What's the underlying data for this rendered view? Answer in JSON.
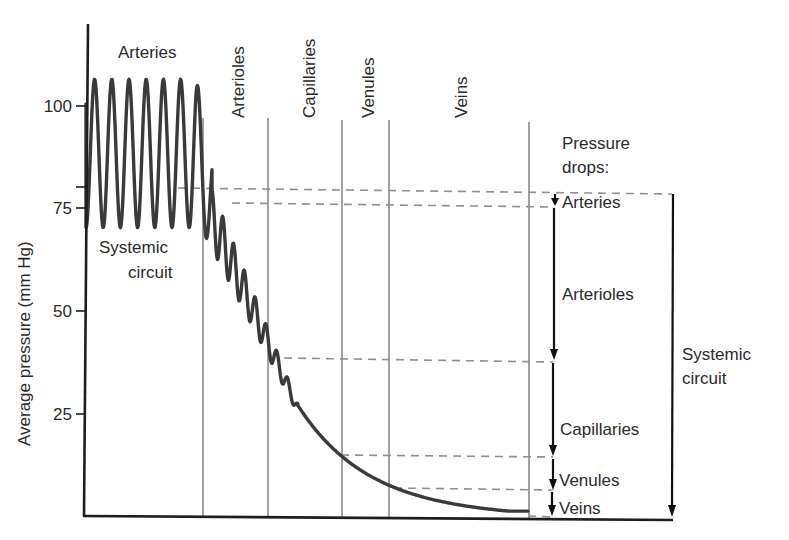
{
  "chart_data": {
    "type": "line",
    "title": "",
    "xlabel": "",
    "ylabel": "Average pressure (mm Hg)",
    "ylim": [
      0,
      120
    ],
    "yticks": [
      25,
      50,
      75,
      100
    ],
    "grid": false,
    "segments": [
      "Arteries",
      "Arterioles",
      "Capillaries",
      "Venules",
      "Veins"
    ],
    "segment_boundaries_px": [
      84,
      203,
      268,
      342,
      389,
      529
    ],
    "series": [
      {
        "name": "Systemic circuit pressure",
        "description": "Pulsatile pressure in arteries oscillating ~70-106 mm Hg (mean ~93), damped oscillations through arterioles falling to ~35 mm Hg, smooth decline through capillaries, venules and veins to ~0-2 mm Hg",
        "points": [
          {
            "segment": "Arteries",
            "systolic": 106,
            "diastolic": 70,
            "mean": 93
          },
          {
            "segment": "Arterioles (start)",
            "mean": 78
          },
          {
            "segment": "Arterioles/Capillaries boundary",
            "mean": 37
          },
          {
            "segment": "Capillaries/Venules boundary",
            "mean": 15
          },
          {
            "segment": "Venules/Veins boundary",
            "mean": 6
          },
          {
            "segment": "Veins (end)",
            "mean": 0
          }
        ]
      }
    ],
    "pressure_drop_levels_mmHg": [
      79,
      76,
      38,
      15,
      7,
      0
    ],
    "annotations": [
      "Arteries",
      "Systemic circuit",
      "Pressure drops:",
      "Arteries",
      "Arterioles",
      "Capillaries",
      "Venules",
      "Veins",
      "Systemic circuit"
    ]
  },
  "labels": {
    "y_axis": "Average pressure (mm Hg)",
    "ticks": [
      "100",
      "75",
      "50",
      "25"
    ],
    "region_arteries": "Arteries",
    "region_arteries_sub_line1": "Systemic",
    "region_arteries_sub_line2": "circuit",
    "region_arterioles": "Arterioles",
    "region_capillaries": "Capillaries",
    "region_venules": "Venules",
    "region_veins": "Veins",
    "drops_title_line1": "Pressure",
    "drops_title_line2": "drops:",
    "drop_arteries": "Arteries",
    "drop_arterioles": "Arterioles",
    "drop_capillaries": "Capillaries",
    "drop_venules": "Venules",
    "drop_veins": "Veins",
    "systemic_line1": "Systemic",
    "systemic_line2": "circuit"
  },
  "colors": {
    "curve": "#3a3a3a",
    "axis": "#1e1e1e",
    "divider": "#8a8a8a",
    "dashed": "#8f8f8f",
    "arrow": "#111111",
    "text": "#2a2a2a"
  }
}
